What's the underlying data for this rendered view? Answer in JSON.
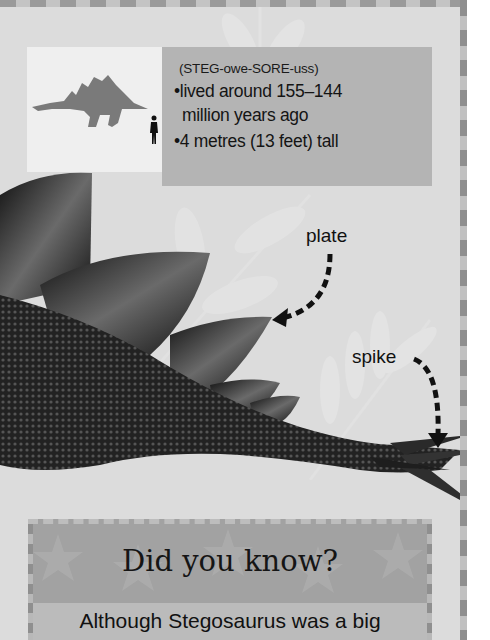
{
  "info_box": {
    "pronunciation": "(STEG-owe-SORE-uss)",
    "facts": [
      {
        "bullet": "•",
        "line1": "lived around 155–144",
        "line2": "million years ago"
      },
      {
        "bullet": "•",
        "line1": "4 metres (13 feet) tall"
      }
    ],
    "silhouette_icons": [
      "stegosaurus-silhouette-icon",
      "human-scale-icon"
    ]
  },
  "labels": {
    "plate": "plate",
    "spike": "spike"
  },
  "did_you_know": {
    "title": "Did you know?",
    "text": "Although Stegosaurus was a big"
  },
  "colors": {
    "page_bg": "#dcdcdc",
    "facts_panel": "#b4b4b4",
    "silhouette_panel": "#efefef",
    "dyk_header": "#a2a2a2",
    "dyk_body": "#bbbbbb",
    "silhouette": "#7a7a7a"
  }
}
